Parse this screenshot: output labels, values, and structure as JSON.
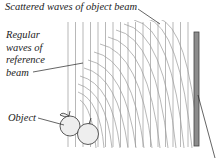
{
  "diagram": {
    "type": "hologram-recording",
    "labels": {
      "scattered": "Scattered waves of object beam",
      "reference": [
        "Regular",
        "waves of",
        "reference",
        "beam"
      ],
      "object": "Object"
    },
    "reference_lines": {
      "x_start": 68,
      "spacing": 7.5,
      "count": 17,
      "y_top": 22,
      "y_bottom": 147
    },
    "plate": {
      "x": 194,
      "y": 32,
      "width": 5,
      "height": 114,
      "fill": "#8c8c8c",
      "stroke": "#444444"
    },
    "colors": {
      "wave": "#9a9a9a",
      "ink": "#222222",
      "apple_fill": "#eeeeee"
    }
  }
}
